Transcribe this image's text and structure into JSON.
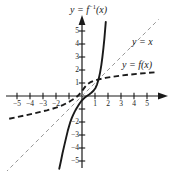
{
  "chart_data": {
    "type": "line",
    "title": "",
    "xlabel": "",
    "ylabel": "",
    "xlim": [
      -6,
      6
    ],
    "ylim": [
      -6,
      6
    ],
    "grid": false,
    "legend_position": "inline-annotations",
    "axis": {
      "x_ticks": [
        -5,
        -4,
        -3,
        -2,
        -1,
        1,
        2,
        3,
        4,
        5
      ],
      "y_ticks": [
        -5,
        -4,
        -3,
        -2,
        -1,
        1,
        2,
        3,
        4,
        5
      ],
      "x_tick_labels": [
        "-5",
        "-4",
        "-3",
        "-2",
        "",
        "1",
        "2",
        "3",
        "4",
        "5"
      ],
      "y_tick_labels": [
        "-5",
        "-4",
        "-3",
        "-2",
        "",
        "1",
        "2",
        "3",
        "4",
        "5"
      ],
      "x_arrow": true,
      "y_arrow": true
    },
    "series": [
      {
        "name": "y = f(x)",
        "style": "dashed",
        "width": 1.9,
        "color": "#1a1a1a",
        "points": [
          [
            -5.6,
            -1.75
          ],
          [
            -5.0,
            -1.62
          ],
          [
            -4.4,
            -1.5
          ],
          [
            -3.8,
            -1.36
          ],
          [
            -3.2,
            -1.22
          ],
          [
            -2.7,
            -1.1
          ],
          [
            -2.3,
            -0.99
          ],
          [
            -2.0,
            -0.9
          ],
          [
            -1.7,
            -0.79
          ],
          [
            -1.45,
            -0.68
          ],
          [
            -1.2,
            -0.56
          ],
          [
            -1.0,
            -0.45
          ],
          [
            -0.8,
            -0.33
          ],
          [
            -0.6,
            -0.2
          ],
          [
            -0.4,
            -0.06
          ],
          [
            -0.25,
            0.08
          ],
          [
            -0.12,
            0.22
          ],
          [
            0.0,
            0.38
          ],
          [
            0.12,
            0.55
          ],
          [
            0.25,
            0.72
          ],
          [
            0.42,
            0.9
          ],
          [
            0.62,
            1.04
          ],
          [
            0.9,
            1.16
          ],
          [
            1.3,
            1.28
          ],
          [
            1.8,
            1.39
          ],
          [
            2.4,
            1.49
          ],
          [
            3.0,
            1.57
          ],
          [
            3.7,
            1.65
          ],
          [
            4.4,
            1.72
          ],
          [
            5.1,
            1.78
          ],
          [
            5.7,
            1.83
          ]
        ]
      },
      {
        "name": "y = f^-1(x)",
        "style": "solid",
        "width": 1.9,
        "color": "#1a1a1a",
        "points": [
          [
            -1.75,
            -5.6
          ],
          [
            -1.62,
            -5.0
          ],
          [
            -1.5,
            -4.4
          ],
          [
            -1.36,
            -3.8
          ],
          [
            -1.22,
            -3.2
          ],
          [
            -1.1,
            -2.7
          ],
          [
            -0.99,
            -2.3
          ],
          [
            -0.9,
            -2.0
          ],
          [
            -0.79,
            -1.7
          ],
          [
            -0.68,
            -1.45
          ],
          [
            -0.56,
            -1.2
          ],
          [
            -0.45,
            -1.0
          ],
          [
            -0.33,
            -0.8
          ],
          [
            -0.2,
            -0.6
          ],
          [
            -0.06,
            -0.4
          ],
          [
            0.08,
            -0.25
          ],
          [
            0.22,
            -0.12
          ],
          [
            0.38,
            0.0
          ],
          [
            0.55,
            0.12
          ],
          [
            0.72,
            0.25
          ],
          [
            0.9,
            0.42
          ],
          [
            1.04,
            0.62
          ],
          [
            1.16,
            0.9
          ],
          [
            1.28,
            1.3
          ],
          [
            1.39,
            1.8
          ],
          [
            1.49,
            2.4
          ],
          [
            1.57,
            3.0
          ],
          [
            1.65,
            3.7
          ],
          [
            1.72,
            4.4
          ],
          [
            1.78,
            5.1
          ],
          [
            1.83,
            5.7
          ]
        ]
      },
      {
        "name": "y = x",
        "style": "dashed-thin",
        "width": 0.9,
        "color": "#8c8c8c",
        "points": [
          [
            -5.9,
            -5.9
          ],
          [
            5.9,
            5.9
          ]
        ]
      }
    ],
    "annotations": [
      {
        "id": "inverse-label",
        "text_prefix": "y = f",
        "text_sup": "-1",
        "text_suffix": "(x)",
        "x_px": 70,
        "y_px": 4
      },
      {
        "id": "identity-label",
        "text": "y = x",
        "x_px": 132,
        "y_px": 37
      },
      {
        "id": "function-label",
        "text_prefix": "y = f",
        "text_suffix": "(x)",
        "x_px": 123,
        "y_px": 61
      }
    ]
  },
  "labels": {
    "inverse_prefix": "y = f",
    "inverse_sup": "−1",
    "inverse_suffix": "(x)",
    "identity": "y = x",
    "function_prefix": "y = f",
    "function_suffix": "(x)"
  },
  "colors": {
    "background": "#ffffff",
    "axis": "#1a1a1a",
    "curve": "#1a1a1a",
    "identity_line": "#8c8c8c",
    "text": "#1a1a1a"
  }
}
